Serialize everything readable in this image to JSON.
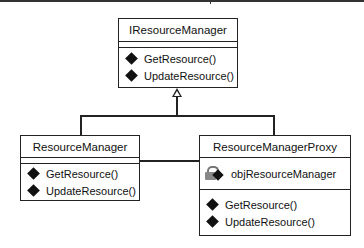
{
  "diagram": {
    "type": "UML class diagram (Proxy pattern)",
    "interface": {
      "name": "IResourceManager",
      "attributes": [],
      "methods": [
        "GetResource()",
        "UpdateResource()"
      ]
    },
    "classes": [
      {
        "name": "ResourceManager",
        "attributes": [],
        "methods": [
          "GetResource()",
          "UpdateResource()"
        ]
      },
      {
        "name": "ResourceManagerProxy",
        "attributes": [
          {
            "icon": "private-attribute-icon",
            "name": "objResourceManager"
          }
        ],
        "methods": [
          "GetResource()",
          "UpdateResource()"
        ]
      }
    ],
    "relationships": [
      {
        "from": "ResourceManager",
        "to": "IResourceManager",
        "type": "realization"
      },
      {
        "from": "ResourceManagerProxy",
        "to": "IResourceManager",
        "type": "realization"
      },
      {
        "from": "ResourceManagerProxy",
        "to": "ResourceManager",
        "type": "association"
      }
    ],
    "icons": {
      "method": "public-method-diamond-icon",
      "attribute": "private-attribute-lock-icon"
    }
  }
}
